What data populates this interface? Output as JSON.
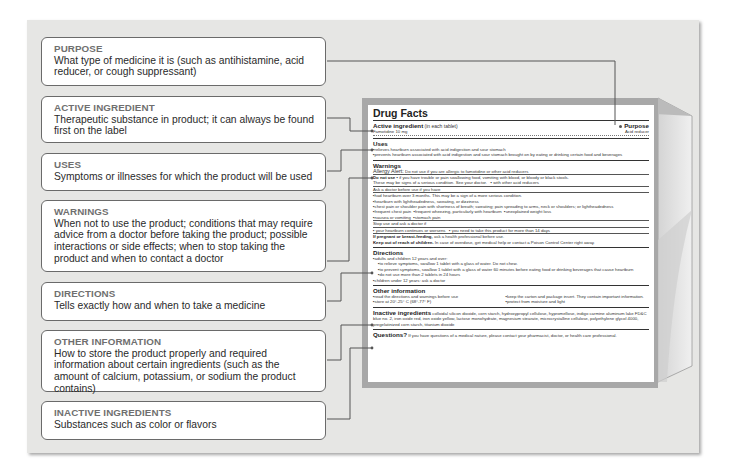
{
  "callouts": [
    {
      "title": "PURPOSE",
      "text": "What type of medicine it is (such as antihistamine, acid reducer, or cough suppressant)"
    },
    {
      "title": "ACTIVE INGREDIENT",
      "text": "Therapeutic substance in product;  it can always be found first on the label"
    },
    {
      "title": "USES",
      "text": "Symptoms or illnesses for which the product will be used"
    },
    {
      "title": "WARNINGS",
      "text": "When not to use the product;  conditions that may require advice from a doctor before taking the product;  possible interactions or side effects;  when to stop taking the product and when to contact a doctor"
    },
    {
      "title": "DIRECTIONS",
      "text": "Tells exactly how and when to take a medicine"
    },
    {
      "title": "OTHER INFORMATION",
      "text": "How to store the product properly and required information about certain ingredients (such as the amount of calcium, potassium, or sodium the product contains)"
    },
    {
      "title": "INACTIVE INGREDIENTS",
      "text": "Substances such as color or flavors"
    }
  ],
  "label": {
    "title": "Drug Facts",
    "active_heading": "Active ingredient",
    "active_sub": " (in each tablet)",
    "active_value": "Famotidine 10 mg",
    "purpose_heading": "Purpose",
    "purpose_value": "Acid reducer",
    "uses_heading": "Uses",
    "uses": [
      "relieves heartburn associated with acid indigestion and sour stomach",
      "prevents heartburn associated with acid indigestion and sour stomach brought on by eating or drinking certain food and beverages"
    ],
    "warnings_heading": "Warnings",
    "allergy_label": "Allergy Alert:",
    "allergy_text": " Do not use if you are allergic to famotidine or other acid reducers",
    "do_not_use_label": "Do not use",
    "do_not_use_text": "if you have trouble or pain swallowing food, vomiting with blood, or bloody or black stools.",
    "serious_text": "These may be signs of a serious condition. See your doctor.",
    "serious_extra": "with other acid reducers",
    "ask_doctor": "Ask a doctor before use if you have",
    "ask_items": [
      "had heartburn over 3 months. This may be a sign of a more serious condition.",
      "heartburn with lightheadedness, sweating, or dizziness",
      "chest pain or shoulder pain with shortness of breath; sweating; pain spreading to arms, neck or shoulders; or lightheadedness"
    ],
    "ask_row4": [
      "frequent chest pain",
      "frequent wheezing, particularly with heartburn",
      "unexplained weight loss"
    ],
    "ask_row5": [
      "nausea or vomiting",
      "stomach pain"
    ],
    "stop_use": "Stop use and ask a doctor if",
    "stop_items": [
      "your heartburn continues or worsens",
      "you need to take this product for more than 14 days"
    ],
    "pregnant_label": "If pregnant or breast-feeding,",
    "pregnant_text": " ask a health professional before use.",
    "reach_label": "Keep out of reach of children.",
    "reach_text": " In case of overdose, get medical help or contact a Poison Control Center right away.",
    "directions_heading": "Directions",
    "directions": [
      "adults and children 12 years and over:",
      "to relieve symptoms, swallow 1 tablet with a glass of water. Do not chew.",
      "to prevent symptoms, swallow 1 tablet with a glass of water 60 minutes before eating food or drinking beverages that cause heartburn",
      "do not use more than 2 tablets in 24 hours",
      "children under 12 years: ask a doctor"
    ],
    "other_heading": "Other information",
    "other": [
      "read the directions and warnings before use",
      "keep the carton and package insert. They contain important information.",
      "store at 20°-25° C (68°-77° F)",
      "protect from moisture and light"
    ],
    "inactive_heading": "Inactive ingredients",
    "inactive_text": " colloidal silicon dioxide, corn starch, hydroxypropyl cellulose, hypromellose, indigo carmine aluminum lake FD&C blue no. 2, iron oxide red, iron oxide yellow, lactose monohydrate, magnesium stearate, microcrystalline cellulose, polyethylene glycol 4000, pregelatinized corn starch, titanium dioxide",
    "questions_heading": "Questions?",
    "questions_text": " If you have questions of a medical nature, please contact your pharmacist, doctor, or health care professional."
  },
  "colors": {
    "panel": "#e6e6e4",
    "callout_border": "#6a6a6a",
    "callout_title": "#6f6f6f",
    "connector": "#555555",
    "box_frame": "#a8a8a8"
  }
}
